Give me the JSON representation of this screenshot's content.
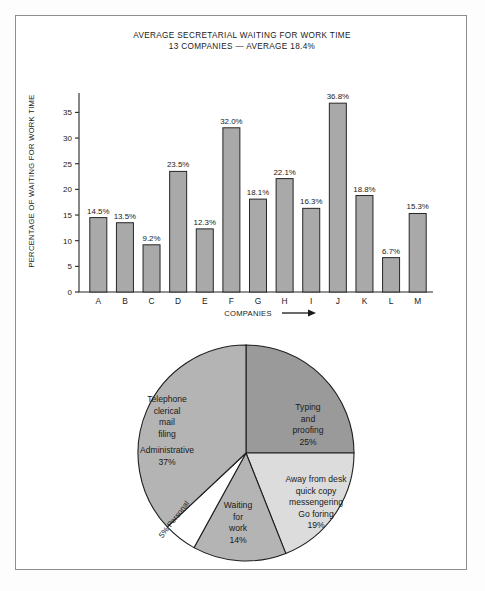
{
  "chart_data": [
    {
      "type": "bar",
      "title": "AVERAGE SECRETARIAL WAITING FOR WORK TIME",
      "subtitle": "13 COMPANIES — AVERAGE 18.4%",
      "xlabel": "COMPANIES",
      "xlabel_arrow": "⟶",
      "ylabel": "PERCENTAGE OF WAITING FOR WORK TIME",
      "categories": [
        "A",
        "B",
        "C",
        "D",
        "E",
        "F",
        "G",
        "H",
        "I",
        "J",
        "K",
        "L",
        "M"
      ],
      "values": [
        14.5,
        13.5,
        9.2,
        23.5,
        12.3,
        32.0,
        18.1,
        22.1,
        16.3,
        36.8,
        18.8,
        6.7,
        15.3
      ],
      "value_labels": [
        "14.5%",
        "13.5%",
        "9.2%",
        "23.5%",
        "12.3%",
        "32.0%",
        "18.1%",
        "22.1%",
        "16.3%",
        "36.8%",
        "18.8%",
        "6.7%",
        "15.3%"
      ],
      "yticks": [
        0,
        5,
        10,
        15,
        20,
        25,
        30,
        35
      ],
      "ytick_labels": [
        "0",
        "5",
        "10",
        "15",
        "20",
        "25",
        "30",
        "35"
      ],
      "ylim": [
        0,
        38
      ],
      "grid": false,
      "bar_color": "#a9a9a9",
      "bar_edge_color": "#262626"
    },
    {
      "type": "pie",
      "slices": [
        {
          "name": "typing-and-proofing",
          "lines": [
            "Typing",
            "and",
            "proofing",
            "25%"
          ],
          "value": 25,
          "percent_label": "25%",
          "color": "#9a9a9a"
        },
        {
          "name": "away-from-desk",
          "lines": [
            "Away from desk",
            "quick copy",
            "messengering",
            "Go foring",
            "19%"
          ],
          "value": 19,
          "percent_label": "19%",
          "color": "#dcdcdc"
        },
        {
          "name": "waiting-for-work",
          "lines": [
            "Waiting",
            "for",
            "work",
            "14%"
          ],
          "value": 14,
          "percent_label": "14%",
          "color": "#b4b4b4"
        },
        {
          "name": "personal",
          "lines": [
            "5% Personal"
          ],
          "value": 5,
          "percent_label": "5%",
          "color": "#ffffff"
        },
        {
          "name": "administrative",
          "lines": [
            "Telephone",
            "clerical",
            "mail",
            "filing",
            "Administrative",
            "37%"
          ],
          "value": 37,
          "percent_label": "37%",
          "color": "#b4b4b4"
        }
      ]
    }
  ]
}
